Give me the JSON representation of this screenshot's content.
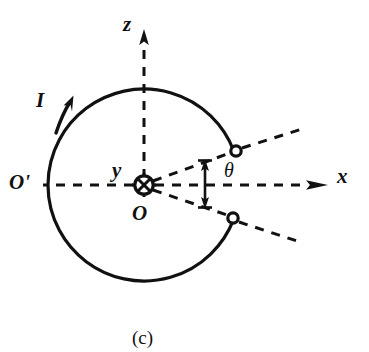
{
  "figure": {
    "caption": "(c)",
    "background_color": "#ffffff",
    "stroke_color": "#111111",
    "labels": {
      "z_axis": "z",
      "x_axis": "x",
      "y_axis": "y",
      "origin": "O",
      "origin_prime": "O'",
      "current": "I",
      "angle": "θ"
    }
  },
  "geometry": {
    "circle": {
      "center_x": 144,
      "center_y": 185,
      "radius": 96,
      "gap_start_deg": -21,
      "gap_end_deg": 21,
      "stroke_width": 3
    },
    "terminals": [
      {
        "name": "upper-terminal",
        "cx": 236,
        "cy": 151,
        "r": 5.5
      },
      {
        "name": "lower-terminal",
        "cx": 233,
        "cy": 218,
        "r": 5.5
      }
    ],
    "axes": {
      "z": {
        "x1": 144,
        "y1": 185,
        "x2": 144,
        "y2": 31
      },
      "x": {
        "x1": 144,
        "y1": 185,
        "x2": 326,
        "y2": 185
      },
      "x_left": {
        "x1": 144,
        "y1": 185,
        "x2": 46,
        "y2": 185
      }
    },
    "lead_lines": [
      {
        "name": "upper-lead-inner",
        "x1": 152,
        "y1": 181,
        "x2": 231,
        "y2": 153
      },
      {
        "name": "upper-lead-outer",
        "x1": 241,
        "y1": 149,
        "x2": 300,
        "y2": 130
      },
      {
        "name": "lower-lead-inner",
        "x1": 152,
        "y1": 190,
        "x2": 228,
        "y2": 216
      },
      {
        "name": "lower-lead-outer",
        "x1": 238,
        "y1": 221,
        "x2": 295,
        "y2": 239
      }
    ],
    "angle_marker": {
      "x": 205,
      "y_top": 160,
      "y_bottom": 208
    },
    "current_arrow": {
      "x1": 56,
      "y1": 131,
      "x2": 72,
      "y2": 100
    },
    "center_symbol": {
      "type": "circle-cross",
      "cx": 144,
      "cy": 185,
      "r": 9
    }
  }
}
